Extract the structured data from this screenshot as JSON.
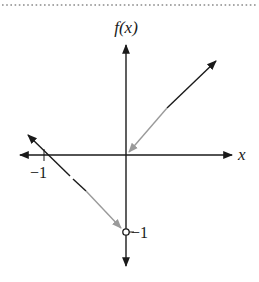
{
  "figure": {
    "type": "piecewise-function-graph",
    "y_axis_label": "f(x)",
    "x_axis_label": "x",
    "tick_labels": {
      "x_neg1": "−1",
      "y_neg1": "−1"
    },
    "colors": {
      "axis": "#1a1a1a",
      "line_dark": "#1a1a1a",
      "line_light": "#9a9a9a",
      "border_dots": "#8a8a8a"
    },
    "pieces": [
      {
        "name": "left-branch",
        "description": "Line with slope -1 through (-1, 0), heading toward open circle at (0, -1)",
        "from": [
          -1.3,
          0.3
        ],
        "to": [
          0,
          -1
        ],
        "endpoint": "open",
        "endpoint_point": [
          0,
          -1
        ]
      },
      {
        "name": "right-branch",
        "description": "Line y = x for x > 0, arrow toward origin",
        "from": [
          0,
          0
        ],
        "to": [
          1.3,
          1.3
        ],
        "endpoint": "arrow-to-origin"
      }
    ]
  }
}
